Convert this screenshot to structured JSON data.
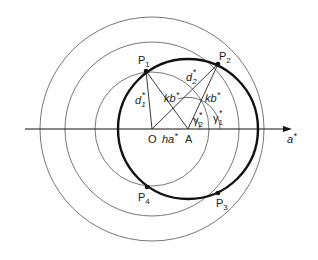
{
  "diagram": {
    "axis": {
      "label": "a",
      "label_sup": "*"
    },
    "origin": {
      "label": "O"
    },
    "point_a": {
      "label": "A"
    },
    "segment_oa": {
      "label": "ha",
      "label_sup": "*"
    },
    "points": [
      {
        "label": "P",
        "sub": "1"
      },
      {
        "label": "P",
        "sub": "2"
      },
      {
        "label": "P",
        "sub": "3"
      },
      {
        "label": "P",
        "sub": "4"
      }
    ],
    "distances": [
      {
        "label": "d",
        "sub": "1",
        "sup": "*"
      },
      {
        "label": "d",
        "sub": "2",
        "sup": "*"
      }
    ],
    "radii": [
      {
        "label": "kb",
        "sup": "*"
      },
      {
        "label": "kb",
        "sup": "*"
      }
    ],
    "angles": [
      {
        "label": "γ",
        "sub": "1",
        "sup": "*"
      },
      {
        "label": "γ",
        "sub": "2",
        "sup": "*"
      }
    ],
    "colors": {
      "line": "#222222",
      "thin": "#555555",
      "background": "#ffffff"
    }
  }
}
